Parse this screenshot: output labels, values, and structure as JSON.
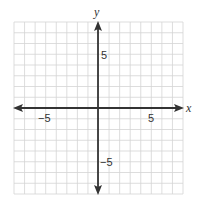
{
  "chart_data": {
    "type": "coordinate_plane",
    "title": "",
    "xlabel": "x",
    "ylabel": "y",
    "xlim": [
      -8,
      8
    ],
    "ylim": [
      -8,
      8
    ],
    "grid": true,
    "grid_step": 1,
    "tick_labels": {
      "x": [
        {
          "value": -5,
          "label": "−5"
        },
        {
          "value": 5,
          "label": "5"
        }
      ],
      "y": [
        {
          "value": 5,
          "label": "5"
        },
        {
          "value": -5,
          "label": "−5"
        }
      ]
    },
    "axes_arrows": true,
    "points": []
  },
  "labels": {
    "x_axis": "x",
    "y_axis": "y",
    "x_neg5": "−5",
    "x_pos5": "5",
    "y_pos5": "5",
    "y_neg5": "−5"
  },
  "colors": {
    "grid": "#d4d4d4",
    "axis": "#333333",
    "background": "#ffffff"
  }
}
